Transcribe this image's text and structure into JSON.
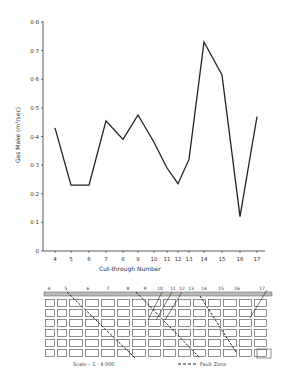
{
  "chart_data": {
    "type": "line",
    "title": "",
    "xlabel": "Cut-through  Number",
    "ylabel": "Gas  Make  (m³/sec)",
    "ylim": [
      0,
      0.8
    ],
    "yticks": [
      "0",
      "0·1",
      "0·2",
      "0·3",
      "0·4",
      "0·5",
      "0·6",
      "0·7",
      "0·8"
    ],
    "categories": [
      "4",
      "5",
      "6",
      "7",
      "8",
      "9",
      "10",
      "11",
      "12",
      "13",
      "14",
      "15",
      "16",
      "17"
    ],
    "values": [
      0.43,
      0.23,
      0.23,
      0.455,
      0.39,
      0.475,
      0.38,
      0.29,
      0.235,
      0.32,
      0.73,
      0.615,
      0.12,
      0.47
    ],
    "grid": false,
    "line_color": "#222222"
  },
  "plan": {
    "labels": [
      "4",
      "5",
      "6",
      "7",
      "8",
      "9",
      "10",
      "11",
      "12",
      "13",
      "14",
      "15",
      "16",
      "17"
    ],
    "scale_text": "Scale  –  1 : 4 000",
    "legend_text": "Fault  Zone"
  }
}
